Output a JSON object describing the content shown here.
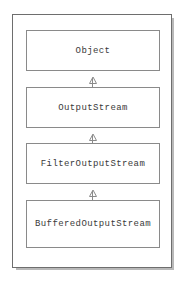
{
  "figure": {
    "type": "uml-class-hierarchy",
    "classes": [
      {
        "name": "Object"
      },
      {
        "name": "OutputStream"
      },
      {
        "name": "FilterOutputStream"
      },
      {
        "name": "BufferedOutputStream"
      }
    ],
    "relations": [
      {
        "kind": "generalization",
        "from": "OutputStream",
        "to": "Object"
      },
      {
        "kind": "generalization",
        "from": "FilterOutputStream",
        "to": "OutputStream"
      },
      {
        "kind": "generalization",
        "from": "BufferedOutputStream",
        "to": "FilterOutputStream"
      }
    ],
    "colors": {
      "page_background": "#ffffff",
      "box_fill": "#ffffff",
      "box_border": "#8a8a8a",
      "frame_border": "#6e6e6e",
      "frame_shadow": "#b9b9b9",
      "text": "#3a3a3a"
    }
  },
  "artifacts": {
    "top_clipped_text": ""
  }
}
